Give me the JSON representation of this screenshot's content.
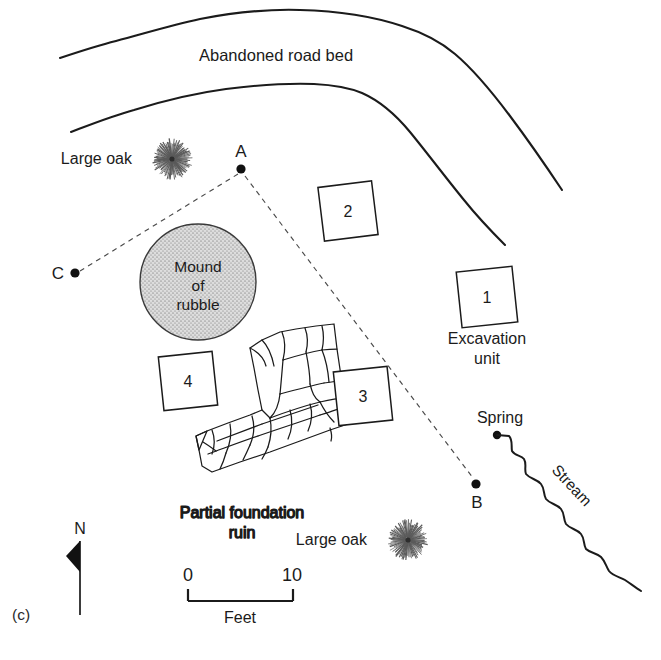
{
  "figure": {
    "panel_label": "(c)",
    "caption_type": "archaeological-site-map"
  },
  "features": {
    "road_bed_label": "Abandoned road bed",
    "large_oak_label_1": "Large oak",
    "large_oak_label_2": "Large oak",
    "mound_line_1": "Mound",
    "mound_line_2": "of",
    "mound_line_3": "rubble",
    "foundation_line_1": "Partial foundation",
    "foundation_line_2": "ruin",
    "spring_label": "Spring",
    "stream_label": "Stream",
    "excavation_line_1": "Excavation",
    "excavation_line_2": "unit"
  },
  "datum_points": [
    {
      "id": "A",
      "label": "A",
      "x": 241,
      "y": 169
    },
    {
      "id": "B",
      "label": "B",
      "x": 476,
      "y": 484
    },
    {
      "id": "C",
      "label": "C",
      "x": 74,
      "y": 273
    }
  ],
  "excavation_units": [
    {
      "number": "1",
      "cx": 487,
      "cy": 297
    },
    {
      "number": "2",
      "cx": 348,
      "cy": 211
    },
    {
      "number": "3",
      "cx": 363,
      "cy": 396
    },
    {
      "number": "4",
      "cx": 188,
      "cy": 381
    }
  ],
  "scale_bar": {
    "start_label": "0",
    "end_label": "10",
    "unit_label": "Feet"
  },
  "compass": {
    "north_label": "N"
  },
  "colors": {
    "ink": "#1b1b1b",
    "paper": "#ffffff",
    "mound_fill": "#d3d3d3",
    "dashed_sightline": "#4a4a4a",
    "oak_ray": "#5a5a5a"
  }
}
